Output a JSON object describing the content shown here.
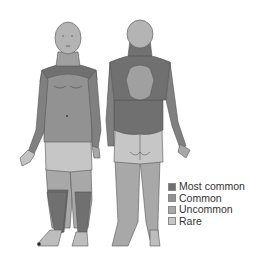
{
  "diagram": {
    "views": [
      {
        "id": "front",
        "label": "Front view"
      },
      {
        "id": "back",
        "label": "Back view"
      }
    ],
    "colors": {
      "most_common": "#707070",
      "common": "#929292",
      "uncommon": "#a8a8a8",
      "rare": "#c6c6c6",
      "outline": "#555555"
    }
  },
  "legend": {
    "items": [
      {
        "label": "Most common",
        "color": "#707070"
      },
      {
        "label": "Common",
        "color": "#929292"
      },
      {
        "label": "Uncommon",
        "color": "#a8a8a8"
      },
      {
        "label": "Rare",
        "color": "#c6c6c6"
      }
    ]
  }
}
